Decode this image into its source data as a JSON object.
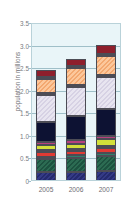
{
  "chart_data": {
    "type": "bar",
    "subtype": "stacked",
    "title": "",
    "xlabel": "",
    "ylabel": "population in millions",
    "categories": [
      "2005",
      "2006",
      "2007"
    ],
    "ylim": [
      0,
      3.5
    ],
    "yticks": [
      0,
      0.5,
      1.0,
      1.5,
      2.0,
      2.5,
      3.0,
      3.5
    ],
    "ytick_labels": [
      "0",
      "0.5",
      "1.0",
      "1.5",
      "2.0",
      "2.5",
      "3.0",
      "3.5"
    ],
    "grid": true,
    "grid_axis": "y",
    "legend": "none",
    "plot_background": "#e9f5f8",
    "series": [
      {
        "name": "segment-1-navy",
        "color": "#2a2f78",
        "hatch": "navy",
        "values": [
          0.2,
          0.21,
          0.23
        ]
      },
      {
        "name": "segment-2-dark-green",
        "color": "#24604a",
        "hatch": "green",
        "values": [
          0.29,
          0.31,
          0.33
        ]
      },
      {
        "name": "segment-3-teal",
        "color": "#2f7f6b",
        "hatch": "none",
        "values": [
          0.05,
          0.05,
          0.06
        ]
      },
      {
        "name": "segment-4-red",
        "color": "#e03a34",
        "hatch": "none",
        "values": [
          0.1,
          0.1,
          0.11
        ]
      },
      {
        "name": "segment-5-orange",
        "color": "#f08a22",
        "hatch": "none",
        "values": [
          0.04,
          0.04,
          0.05
        ]
      },
      {
        "name": "segment-6-yellow-green",
        "color": "#d3e03a",
        "hatch": "none",
        "values": [
          0.11,
          0.12,
          0.14
        ]
      },
      {
        "name": "segment-7-magenta",
        "color": "#b8407e",
        "hatch": "none",
        "values": [
          0.07,
          0.07,
          0.08
        ]
      },
      {
        "name": "segment-8-dark-navy",
        "color": "#0d1233",
        "hatch": "none",
        "values": [
          0.45,
          0.55,
          0.6
        ]
      },
      {
        "name": "segment-9-lavender",
        "color": "#ddd8e8",
        "hatch": "lavender",
        "values": [
          0.6,
          0.63,
          0.7
        ]
      },
      {
        "name": "segment-10-blue-line",
        "color": "#2f6fc4",
        "hatch": "none",
        "values": [
          0.04,
          0.04,
          0.04
        ]
      },
      {
        "name": "segment-11-peach",
        "color": "#f7b682",
        "hatch": "peach",
        "values": [
          0.31,
          0.38,
          0.42
        ]
      },
      {
        "name": "segment-12-gold",
        "color": "#e8a313",
        "hatch": "none",
        "values": [
          0.04,
          0.04,
          0.05
        ]
      },
      {
        "name": "segment-13-dark-red",
        "color": "#8e1f2c",
        "hatch": "none",
        "values": [
          0.16,
          0.17,
          0.2
        ]
      }
    ],
    "totals": [
      2.66,
      2.88,
      3.16
    ]
  }
}
